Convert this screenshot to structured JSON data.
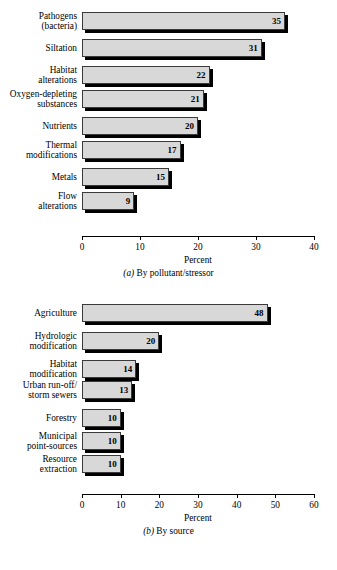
{
  "chart_data": [
    {
      "id": "a",
      "type": "bar",
      "orientation": "horizontal",
      "title": "",
      "caption_prefix": "(a)",
      "caption_text": " By pollutant/stressor",
      "xlabel": "Percent",
      "ylabel": "",
      "xlim": [
        0,
        40
      ],
      "xticks": [
        0,
        10,
        20,
        30,
        40
      ],
      "xticklabels": [
        "0",
        "10",
        "20",
        "30",
        "40"
      ],
      "grid": false,
      "legend": "none",
      "categories": [
        "Pathogens\n(bacteria)",
        "Siltation",
        "Habitat\nalterations",
        "Oxygen-depleting\nsubstances",
        "Nutrients",
        "Thermal\nmodifications",
        "Metals",
        "Flow\nalterations"
      ],
      "values": [
        35,
        31,
        22,
        21,
        20,
        17,
        15,
        9
      ],
      "value_labels": [
        "35",
        "31",
        "22",
        "21",
        "20",
        "17",
        "15",
        "9"
      ]
    },
    {
      "id": "b",
      "type": "bar",
      "orientation": "horizontal",
      "title": "",
      "caption_prefix": "(b)",
      "caption_text": " By source",
      "xlabel": "Percent",
      "ylabel": "",
      "xlim": [
        0,
        60
      ],
      "xticks": [
        0,
        10,
        20,
        30,
        40,
        50,
        60
      ],
      "xticklabels": [
        "0",
        "10",
        "20",
        "30",
        "40",
        "50",
        "60"
      ],
      "grid": false,
      "legend": "none",
      "categories": [
        "Agriculture",
        "Hydrologic\nmodification",
        "Habitat\nmodification",
        "Urban run-off/\nstorm sewers",
        "Forestry",
        "Municipal\npoint-sources",
        "Resource\nextraction"
      ],
      "values": [
        48,
        20,
        14,
        13,
        10,
        10,
        10
      ],
      "value_labels": [
        "48",
        "20",
        "14",
        "13",
        "10",
        "10",
        "10"
      ]
    }
  ],
  "style": {
    "bar_fill": "#d8d8d8",
    "bar_stroke": "#3a3a3a",
    "shadow": "#000000",
    "background": "#ffffff",
    "text": "#000000"
  }
}
